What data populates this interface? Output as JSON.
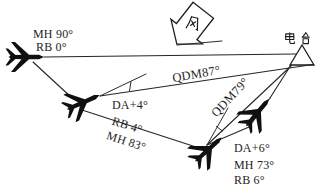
{
  "diagram": {
    "wind_label": "风",
    "station_label": "电台",
    "start": {
      "mh": "MH 90°",
      "rb": "RB 0°"
    },
    "fix1": {
      "qdm": "QDM87°",
      "da": "DA+4°",
      "rb": "RB 4°",
      "mh": "MH 83°"
    },
    "fix2": {
      "qdm": "QDM79°",
      "da": "DA+6°",
      "mh": "MH 73°",
      "rb": "RB 6°"
    }
  },
  "colors": {
    "ink": "#262626",
    "paper": "#ffffff"
  }
}
